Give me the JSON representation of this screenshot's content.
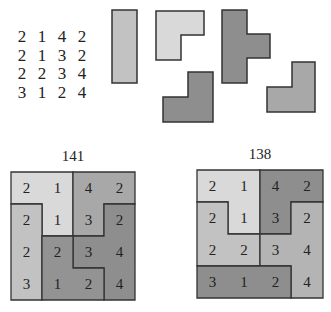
{
  "matrix": {
    "rows": [
      [
        2,
        1,
        4,
        2
      ],
      [
        2,
        1,
        3,
        2
      ],
      [
        2,
        2,
        3,
        4
      ],
      [
        3,
        1,
        2,
        4
      ]
    ]
  },
  "colors": {
    "lightest": "#d9d9d9",
    "light": "#c2c2c2",
    "medium": "#a8a8a8",
    "dark": "#8e8e8e",
    "stroke": "#333333"
  },
  "pieces": [
    {
      "name": "vertical-bar",
      "shape": "I3",
      "color": "light"
    },
    {
      "name": "light-l",
      "shape": "L3",
      "color": "lightest"
    },
    {
      "name": "dark-l",
      "shape": "L3",
      "color": "dark"
    },
    {
      "name": "t-piece",
      "shape": "T4",
      "color": "dark"
    },
    {
      "name": "medium-l",
      "shape": "L3",
      "color": "medium"
    }
  ],
  "grids": [
    {
      "title": "141",
      "cells": [
        [
          2,
          1,
          4,
          2
        ],
        [
          2,
          1,
          3,
          2
        ],
        [
          2,
          2,
          3,
          4
        ],
        [
          3,
          1,
          2,
          4
        ]
      ],
      "regions": [
        [
          0,
          0,
          1,
          1
        ],
        [
          0,
          0,
          2,
          2
        ],
        [
          0,
          0,
          1,
          1
        ],
        [
          0,
          1,
          2,
          3
        ]
      ]
    },
    {
      "title": "138",
      "cells": [
        [
          2,
          1,
          4,
          2
        ],
        [
          2,
          1,
          3,
          2
        ],
        [
          2,
          2,
          3,
          4
        ],
        [
          3,
          1,
          2,
          4
        ]
      ]
    }
  ]
}
